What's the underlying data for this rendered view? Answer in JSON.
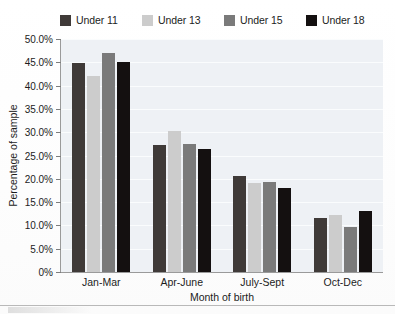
{
  "chart_data": {
    "type": "bar",
    "title": "",
    "xlabel": "Month of birth",
    "ylabel": "Percentage of sample",
    "categories": [
      "Jan-Mar",
      "Apr-June",
      "July-Sept",
      "Oct-Dec"
    ],
    "series": [
      {
        "name": "Under 11",
        "color": "#3f3a38",
        "values": [
          44.8,
          27.2,
          20.5,
          11.5
        ]
      },
      {
        "name": "Under 13",
        "color": "#cccccc",
        "values": [
          42.0,
          30.2,
          19.0,
          12.2
        ]
      },
      {
        "name": "Under 15",
        "color": "#7a7a7a",
        "values": [
          47.0,
          27.4,
          19.4,
          9.6
        ]
      },
      {
        "name": "Under 18",
        "color": "#141010",
        "values": [
          45.1,
          26.5,
          18.1,
          13.0
        ]
      }
    ],
    "ylim": [
      0,
      50
    ],
    "ytick_values": [
      50,
      45,
      40,
      35,
      30,
      25,
      20,
      15,
      10,
      5,
      0
    ],
    "ytick_labels": [
      "50.0%",
      "45.0%",
      "40.0%",
      "35.0%",
      "30.0%",
      "25.0%",
      "20.0%",
      "15.0%",
      "10.0%",
      "5.0%",
      "0%"
    ],
    "grid": true,
    "legend_position": "top",
    "plot_background": "#eef1f5",
    "axis_color": "#9a9a9a"
  }
}
